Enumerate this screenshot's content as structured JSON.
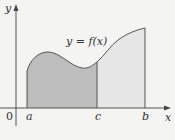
{
  "diagram": {
    "curve_label": "y = f(x)",
    "axis_labels": {
      "x": "x",
      "y": "y"
    },
    "origin_label": "0",
    "points": {
      "a": "a",
      "c": "c",
      "b": "b"
    },
    "colors": {
      "background": "#f4f4f3",
      "region_a_to_c": "#bdbdbd",
      "region_c_to_b": "#e6e6e6",
      "stroke": "#555555"
    },
    "regions": [
      {
        "name": "area-from-a-to-c",
        "from": "a",
        "to": "c",
        "shade": "dark"
      },
      {
        "name": "area-from-c-to-b",
        "from": "c",
        "to": "b",
        "shade": "light"
      }
    ]
  }
}
